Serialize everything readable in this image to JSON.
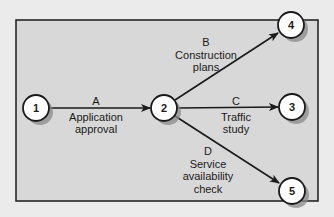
{
  "diagram": {
    "type": "activity-on-arrow network",
    "colors": {
      "page_background": "#ebebeb",
      "panel_fill": "#d8d8d8",
      "panel_border": "#1a1a1a",
      "node_fill": "#ffffff",
      "node_shadow": "#8a8a8a",
      "arrow": "#1a1a1a",
      "text": "#1a1a1a"
    },
    "nodes": [
      {
        "id": "1",
        "label": "1",
        "x": 36,
        "y": 108
      },
      {
        "id": "2",
        "label": "2",
        "x": 164,
        "y": 108
      },
      {
        "id": "3",
        "label": "3",
        "x": 292,
        "y": 107
      },
      {
        "id": "4",
        "label": "4",
        "x": 291,
        "y": 25
      },
      {
        "id": "5",
        "label": "5",
        "x": 292,
        "y": 191
      }
    ],
    "activities": [
      {
        "from": "1",
        "to": "2",
        "letter": "A",
        "line1": "Application",
        "line2": "approval"
      },
      {
        "from": "2",
        "to": "4",
        "letter": "B",
        "line1": "Construction",
        "line2": "plans"
      },
      {
        "from": "2",
        "to": "3",
        "letter": "C",
        "line1": "Traffic",
        "line2": "study"
      },
      {
        "from": "2",
        "to": "5",
        "letter": "D",
        "line1": "Service",
        "line2": "availability",
        "line3": "check"
      }
    ]
  }
}
